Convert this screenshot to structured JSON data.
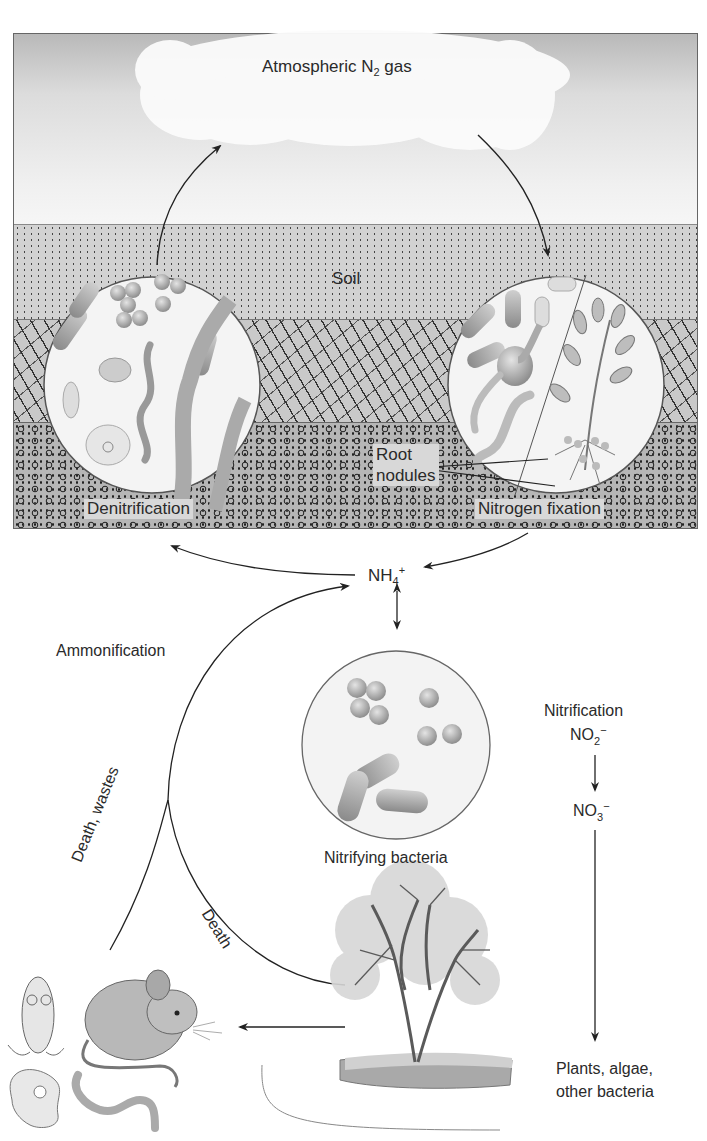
{
  "diagram": {
    "colors": {
      "sky_top": "#b9b9b9",
      "sky_bottom": "#f2f2f2",
      "cloud": "#fbfbfb",
      "soil_top": "#cfcfcf",
      "soil_middle": "#c4c4c4",
      "soil_bottom": "#b3b3b3",
      "frame": "#666666",
      "line": "#2a2a2a",
      "microbe": "#9a9a9a",
      "circle_fill": "#f4f4f4"
    },
    "atmosphere": {
      "label_main": "Atmospheric N",
      "label_sub": "2",
      "label_tail": " gas"
    },
    "soil": {
      "label": "Soil"
    },
    "processes": {
      "denitrification": "Denitrification",
      "nitrogen_fixation": "Nitrogen fixation",
      "root_nodules_line1": "Root",
      "root_nodules_line2": "nodules",
      "ammonification": "Ammonification",
      "nitrification": "Nitrification",
      "nitrifying_bacteria": "Nitrifying bacteria",
      "death_wastes": "Death, wastes",
      "death": "Death"
    },
    "compounds": {
      "ammonium_main": "NH",
      "ammonium_sub": "4",
      "ammonium_sup": "+",
      "nitrite_main": "NO",
      "nitrite_sub": "2",
      "nitrite_sup": "−",
      "nitrate_main": "NO",
      "nitrate_sub": "3",
      "nitrate_sup": "−"
    },
    "consumers": {
      "plants_line1": "Plants, algae,",
      "plants_line2": "other bacteria"
    },
    "nodes": [
      {
        "id": "atmosphere",
        "label": "Atmospheric N2 gas"
      },
      {
        "id": "denitrification",
        "label": "Denitrification"
      },
      {
        "id": "nitrogen_fixation",
        "label": "Nitrogen fixation"
      },
      {
        "id": "ammonium",
        "label": "NH4+"
      },
      {
        "id": "nitrifying_bacteria",
        "label": "Nitrifying bacteria"
      },
      {
        "id": "nitrite",
        "label": "NO2-"
      },
      {
        "id": "nitrate",
        "label": "NO3-"
      },
      {
        "id": "plants",
        "label": "Plants, algae, other bacteria"
      },
      {
        "id": "tree",
        "label": ""
      },
      {
        "id": "animals_microbes",
        "label": ""
      }
    ],
    "edges": [
      {
        "from": "denitrification",
        "to": "atmosphere"
      },
      {
        "from": "atmosphere",
        "to": "nitrogen_fixation"
      },
      {
        "from": "nitrogen_fixation",
        "to": "ammonium"
      },
      {
        "from": "ammonium",
        "to": "denitrification"
      },
      {
        "from": "ammonium",
        "to": "nitrifying_bacteria",
        "bidirectional": true
      },
      {
        "from": "nitrite",
        "to": "nitrate"
      },
      {
        "from": "nitrate",
        "to": "plants"
      },
      {
        "from": "tree",
        "to": "animals_microbes"
      },
      {
        "from": "animals_microbes",
        "to": "ammonium",
        "label": "Death, wastes / Ammonification"
      },
      {
        "from": "tree",
        "to": "ammonium",
        "label": "Death"
      }
    ]
  }
}
